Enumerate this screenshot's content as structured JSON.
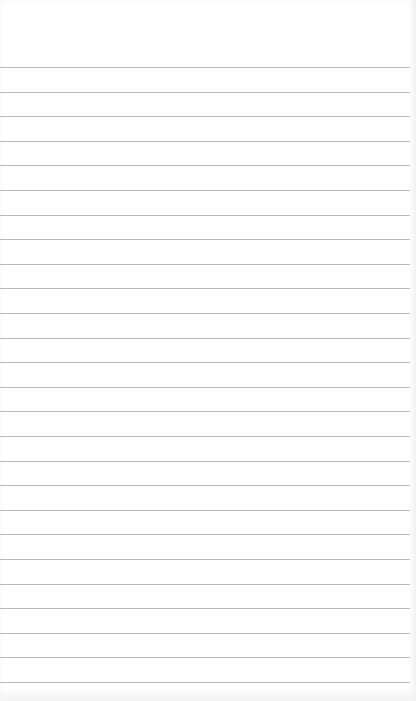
{
  "notepad": {
    "header_text": "",
    "line_count": 26,
    "first_line_y": 67,
    "line_spacing": 24.6,
    "line_color": "#b9b9b9",
    "paper_color": "#ffffff",
    "lines": [
      "",
      "",
      "",
      "",
      "",
      "",
      "",
      "",
      "",
      "",
      "",
      "",
      "",
      "",
      "",
      "",
      "",
      "",
      "",
      "",
      "",
      "",
      "",
      "",
      "",
      ""
    ]
  }
}
